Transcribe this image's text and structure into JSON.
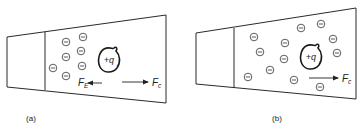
{
  "figure": {
    "panels": [
      {
        "id": "a",
        "caption": "(a)",
        "charge_label": "+q",
        "forces": [
          {
            "symbol": "F",
            "subscript": "E",
            "direction": "left"
          },
          {
            "symbol": "F",
            "subscript": "c",
            "direction": "right"
          }
        ],
        "electron_symbol": "−",
        "electron_count": 7
      },
      {
        "id": "b",
        "caption": "(b)",
        "charge_label": "+q",
        "forces": [
          {
            "symbol": "F",
            "subscript": "c",
            "direction": "right"
          }
        ],
        "electron_symbol": "−",
        "electron_count": 12
      }
    ]
  }
}
